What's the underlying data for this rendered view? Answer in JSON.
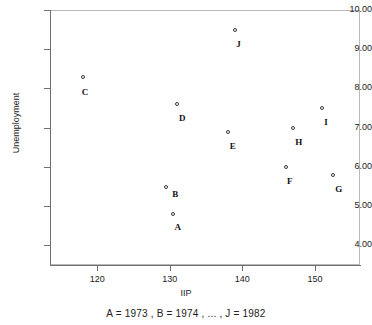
{
  "chart_data": {
    "type": "scatter",
    "title": "",
    "xlabel": "IIP",
    "ylabel": "Unemployment",
    "caption": "A = 1973 , B = 1974 , ... , J = 1982",
    "xlim": [
      113.5,
      156.2
    ],
    "ylim": [
      3.5,
      10.0
    ],
    "xticks": [
      120,
      130,
      140,
      150
    ],
    "xtick_labels": [
      "120",
      "130",
      "140",
      "150"
    ],
    "yticks": [
      4,
      5,
      6,
      7,
      8,
      9,
      10
    ],
    "ytick_labels": [
      "4.00",
      "5.00",
      "6.00",
      "7.00",
      "8.00",
      "9.00",
      "10.00"
    ],
    "grid": false,
    "legend": "none",
    "marker": "open-circle",
    "points": [
      {
        "label": "A",
        "year": 1973,
        "x": 130.5,
        "y": 4.8,
        "label_dx": 1,
        "label_dy": 9
      },
      {
        "label": "B",
        "year": 1974,
        "x": 129.5,
        "y": 5.5,
        "label_dx": 6,
        "label_dy": 3
      },
      {
        "label": "C",
        "year": 1975,
        "x": 118.0,
        "y": 8.3,
        "label_dx": -1,
        "label_dy": 11
      },
      {
        "label": "D",
        "year": 1976,
        "x": 131.0,
        "y": 7.6,
        "label_dx": 2,
        "label_dy": 10
      },
      {
        "label": "E",
        "year": 1977,
        "x": 138.0,
        "y": 6.9,
        "label_dx": 2,
        "label_dy": 10
      },
      {
        "label": "F",
        "year": 1978,
        "x": 146.0,
        "y": 6.0,
        "label_dx": 1,
        "label_dy": 10
      },
      {
        "label": "G",
        "year": 1979,
        "x": 152.5,
        "y": 5.8,
        "label_dx": 2,
        "label_dy": 10
      },
      {
        "label": "H",
        "year": 1980,
        "x": 147.0,
        "y": 7.0,
        "label_dx": 2,
        "label_dy": 10
      },
      {
        "label": "I",
        "year": 1981,
        "x": 151.0,
        "y": 7.5,
        "label_dx": 2,
        "label_dy": 10
      },
      {
        "label": "J",
        "year": 1982,
        "x": 139.0,
        "y": 9.5,
        "label_dx": 1,
        "label_dy": 10
      }
    ]
  }
}
